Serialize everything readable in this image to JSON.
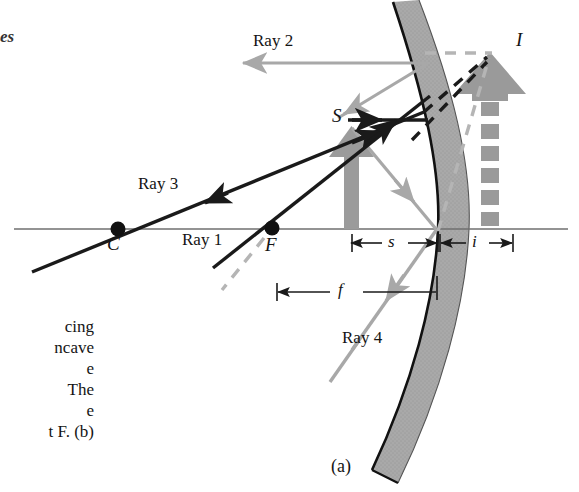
{
  "figure": {
    "panel_label": "(a)",
    "topic": "concave-mirror-ray-tracing",
    "page_corner_text": "es"
  },
  "colors": {
    "axis": "#6f6f6f",
    "mirror_fill": "#a9a9a9",
    "mirror_outline": "#111111",
    "ray_dark": "#1a1a1a",
    "ray_light": "#a8a8a8",
    "object_arrow": "#999999",
    "image_arrow": "#9a9a9a",
    "dash_dark": "#1a1a1a",
    "dash_light": "#b5b5b5",
    "text": "#141414",
    "background": "#ffffff"
  },
  "labels": {
    "ray1": "Ray 1",
    "ray2": "Ray 2",
    "ray3": "Ray 3",
    "ray4": "Ray 4",
    "center_of_curvature": "C",
    "focal_point": "F",
    "source_object": "S",
    "image_point": "I"
  },
  "dimensions": [
    {
      "name": "object-distance",
      "symbol": "s"
    },
    {
      "name": "image-distance",
      "symbol": "i"
    },
    {
      "name": "focal-length",
      "symbol": "f"
    }
  ],
  "caption_fragment_lines": [
    "cing",
    "ncave",
    "e",
    "The",
    "e",
    "t F. (b)"
  ],
  "geometry": {
    "optical_axis_y": 229,
    "mirror_vertex_x": 438,
    "center_x": 118,
    "focus_x": 272,
    "object_top_y": 128,
    "object_base_x": 352,
    "image_top_y": 52,
    "image_base_x": 489
  }
}
